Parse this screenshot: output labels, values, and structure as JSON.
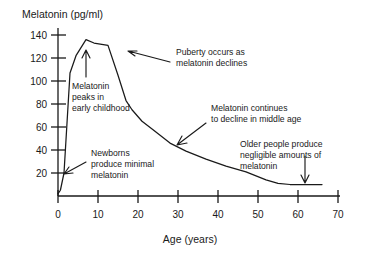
{
  "chart_data": {
    "type": "line",
    "title": "",
    "ylabel": "Melatonin (pg/ml)",
    "xlabel": "Age (years)",
    "xlim": [
      0,
      70
    ],
    "ylim": [
      0,
      145
    ],
    "xticks": [
      0,
      10,
      20,
      30,
      40,
      50,
      60,
      70
    ],
    "yticks": [
      20,
      40,
      60,
      80,
      100,
      120,
      140
    ],
    "xtick_labels": [
      "0",
      "10",
      "20",
      "30",
      "40",
      "50",
      "60",
      "70"
    ],
    "ytick_labels": [
      "20",
      "40",
      "60",
      "80",
      "100",
      "120",
      "140"
    ],
    "grid": false,
    "legend": false,
    "series": [
      {
        "name": "Melatonin level",
        "x": [
          0,
          0.6,
          1.5,
          3,
          4.5,
          7,
          9,
          12.5,
          15,
          17,
          18.5,
          21,
          24,
          28,
          32,
          37,
          42,
          47,
          52,
          55,
          58,
          62,
          66
        ],
        "values": [
          2,
          5,
          20,
          107,
          122,
          136,
          133,
          131,
          105,
          83,
          75,
          65,
          57,
          46,
          39,
          32,
          26,
          21,
          14,
          11,
          10,
          10,
          10
        ]
      }
    ],
    "annotations": [
      {
        "id": "newborns",
        "text": [
          "Newborns",
          "produce minimal",
          "melatonin"
        ],
        "target": "curve start near age 0"
      },
      {
        "id": "peak",
        "text": [
          "Melatonin",
          "peaks in",
          "early childhood"
        ],
        "target": "curve peak near age 7"
      },
      {
        "id": "puberty",
        "text": [
          "Puberty occurs as",
          "melatonin declines"
        ],
        "target": "curve decline near age 13"
      },
      {
        "id": "middle-age",
        "text": [
          "Melatonin continues",
          "to decline in middle age"
        ],
        "target": "curve near age 30"
      },
      {
        "id": "older-people",
        "text": [
          "Older people produce",
          "negligible amounts of",
          "melatonin"
        ],
        "target": "curve tail near age 60"
      }
    ]
  },
  "colors": {
    "ink": "#1a1a1a",
    "background": "#ffffff"
  }
}
